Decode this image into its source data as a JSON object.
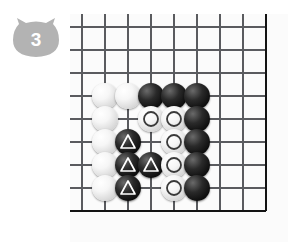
{
  "badge": {
    "icon": "cat-head-badge",
    "number": "3",
    "fill_color": "#b3b3b3",
    "text_color": "#ffffff"
  },
  "board": {
    "type": "go-board-diagram",
    "columns": 9,
    "rows": 9,
    "line_color": "#55565a",
    "edge_color": "#1a1a1a",
    "background_color": "#fbfbfb",
    "corner": "bottom-right",
    "grid_spacing_px": 23,
    "marks": {
      "triangle_label": "triangle-mark",
      "circle_label": "circle-mark",
      "triangle_color": "#ffffff",
      "circle_color": "#3a3a3a"
    },
    "stones": [
      {
        "col": 2,
        "row": 4,
        "color": "white",
        "mark": "none"
      },
      {
        "col": 3,
        "row": 4,
        "color": "white",
        "mark": "none"
      },
      {
        "col": 4,
        "row": 4,
        "color": "black",
        "mark": "none"
      },
      {
        "col": 5,
        "row": 4,
        "color": "black",
        "mark": "none"
      },
      {
        "col": 6,
        "row": 4,
        "color": "black",
        "mark": "none"
      },
      {
        "col": 2,
        "row": 5,
        "color": "white",
        "mark": "none"
      },
      {
        "col": 4,
        "row": 5,
        "color": "white",
        "mark": "circle"
      },
      {
        "col": 5,
        "row": 5,
        "color": "white",
        "mark": "circle"
      },
      {
        "col": 6,
        "row": 5,
        "color": "black",
        "mark": "none"
      },
      {
        "col": 2,
        "row": 6,
        "color": "white",
        "mark": "none"
      },
      {
        "col": 3,
        "row": 6,
        "color": "black",
        "mark": "triangle"
      },
      {
        "col": 5,
        "row": 6,
        "color": "white",
        "mark": "circle"
      },
      {
        "col": 6,
        "row": 6,
        "color": "black",
        "mark": "none"
      },
      {
        "col": 2,
        "row": 7,
        "color": "white",
        "mark": "none"
      },
      {
        "col": 3,
        "row": 7,
        "color": "black",
        "mark": "triangle"
      },
      {
        "col": 4,
        "row": 7,
        "color": "black",
        "mark": "triangle"
      },
      {
        "col": 5,
        "row": 7,
        "color": "white",
        "mark": "circle"
      },
      {
        "col": 6,
        "row": 7,
        "color": "black",
        "mark": "none"
      },
      {
        "col": 2,
        "row": 8,
        "color": "white",
        "mark": "none"
      },
      {
        "col": 3,
        "row": 8,
        "color": "black",
        "mark": "triangle"
      },
      {
        "col": 5,
        "row": 8,
        "color": "white",
        "mark": "circle"
      },
      {
        "col": 6,
        "row": 8,
        "color": "black",
        "mark": "none"
      }
    ]
  }
}
